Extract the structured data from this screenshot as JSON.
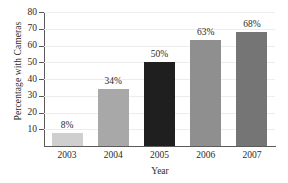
{
  "chart_data": {
    "type": "bar",
    "title": "",
    "xlabel": "Year",
    "ylabel": "Percentage with Cameras",
    "categories": [
      "2003",
      "2004",
      "2005",
      "2006",
      "2007"
    ],
    "values": [
      8,
      34,
      50,
      63,
      68
    ],
    "data_labels": [
      "8%",
      "34%",
      "50%",
      "63%",
      "68%"
    ],
    "ylim": [
      0,
      80
    ],
    "yticks": [
      80,
      70,
      60,
      50,
      40,
      30,
      20,
      10
    ],
    "ytick_labels": [
      "80",
      "70",
      "60",
      "50",
      "40",
      "30",
      "20",
      "10"
    ],
    "grid": true,
    "legend": "none",
    "bar_colors": [
      "#cfcfcf",
      "#a8a8a8",
      "#1f1f1f",
      "#8f8f8f",
      "#757575"
    ],
    "axis_color": "#5a5a5a",
    "grid_color": "#ededed",
    "background": "#ffffff",
    "text_color": "#2b2b2b"
  }
}
